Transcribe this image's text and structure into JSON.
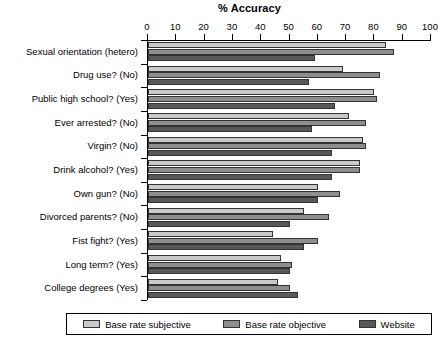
{
  "chart_data": {
    "type": "bar",
    "orientation": "horizontal",
    "title": "% Accuracy",
    "xlabel": "% Accuracy",
    "ylabel": "",
    "xlim": [
      0,
      100
    ],
    "xticks": [
      0,
      10,
      20,
      30,
      40,
      50,
      60,
      70,
      80,
      90,
      100
    ],
    "grid": false,
    "legend_position": "bottom",
    "categories": [
      "Sexual orientation (hetero)",
      "Drug use? (No)",
      "Public high school? (Yes)",
      "Ever arrested? (No)",
      "Virgin? (No)",
      "Drink alcohol? (Yes)",
      "Own gun? (No)",
      "Divorced parents? (No)",
      "Fist fight? (Yes)",
      "Long term? (Yes)",
      "College degrees (Yes)"
    ],
    "series": [
      {
        "name": "Base rate subjective",
        "color": "#c9c9c9",
        "values": [
          84,
          69,
          80,
          71,
          76,
          75,
          60,
          55,
          44,
          47,
          46
        ]
      },
      {
        "name": "Base rate objective",
        "color": "#8e8e8e",
        "values": [
          87,
          82,
          81,
          77,
          77,
          75,
          68,
          64,
          60,
          51,
          50
        ]
      },
      {
        "name": "Website",
        "color": "#585858",
        "values": [
          59,
          57,
          66,
          58,
          65,
          65,
          60,
          50,
          55,
          50,
          53
        ]
      }
    ]
  },
  "legend": {
    "items": [
      {
        "label": "Base rate subjective",
        "color": "#c9c9c9"
      },
      {
        "label": "Base rate objective",
        "color": "#8e8e8e"
      },
      {
        "label": "Website",
        "color": "#585858"
      }
    ]
  }
}
